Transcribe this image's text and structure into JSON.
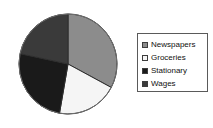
{
  "chart_data": {
    "type": "pie",
    "title": "",
    "subtitle": "",
    "xlabel": "",
    "ylabel": "",
    "grid": false,
    "legend_position": "right",
    "start_angle_deg": 0,
    "direction": "clockwise",
    "categories": [
      "Newspapers",
      "Groceries",
      "Stationary",
      "Wages"
    ],
    "values": [
      32.8,
      20.0,
      25.6,
      21.6
    ],
    "value_unit": "percent",
    "slices": [
      {
        "label": "Newspapers",
        "value": 32.8,
        "start_angle_deg": 0,
        "end_angle_deg": 118,
        "color": "#8c8c8c",
        "edge_color": "#2e2e2e",
        "swatch_name": "legend-swatch-newspapers"
      },
      {
        "label": "Groceries",
        "value": 20.0,
        "start_angle_deg": 118,
        "end_angle_deg": 190,
        "color": "#f5f5f5",
        "edge_color": "#2e2e2e",
        "swatch_name": "legend-swatch-groceries"
      },
      {
        "label": "Stationary",
        "value": 25.6,
        "start_angle_deg": 190,
        "end_angle_deg": 282,
        "color": "#1a1a1a",
        "edge_color": "#2e2e2e",
        "swatch_name": "legend-swatch-stationary"
      },
      {
        "label": "Wages",
        "value": 21.6,
        "start_angle_deg": 282,
        "end_angle_deg": 360,
        "color": "#3a3a3a",
        "edge_color": "#2e2e2e",
        "swatch_name": "legend-swatch-wages"
      }
    ]
  },
  "legend": {
    "border_color": "#5a5a5a",
    "background": "#ffffff",
    "items": [
      {
        "label": "Newspapers",
        "color": "#8c8c8c"
      },
      {
        "label": "Groceries",
        "color": "#f5f5f5"
      },
      {
        "label": "Stationary",
        "color": "#1a1a1a"
      },
      {
        "label": "Wages",
        "color": "#3a3a3a"
      }
    ]
  },
  "figure": {
    "background": "#ffffff",
    "pie_center_x": 50,
    "pie_center_y": 51,
    "pie_radius_x": 49,
    "pie_radius_y": 50,
    "pie_outline_color": "#6e6e6e"
  }
}
